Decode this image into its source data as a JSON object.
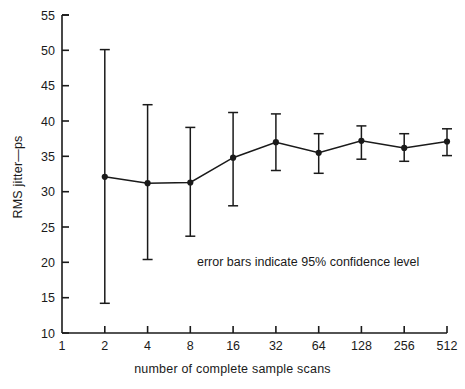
{
  "chart_data": {
    "type": "line",
    "title": "",
    "xlabel": "number of complete sample scans",
    "ylabel": "RMS jitter—ps",
    "x_tick_labels": [
      "1",
      "2",
      "4",
      "8",
      "16",
      "32",
      "64",
      "128",
      "256",
      "512"
    ],
    "x_scale": "log2",
    "y_tick_labels": [
      "10",
      "15",
      "20",
      "25",
      "30",
      "35",
      "40",
      "45",
      "50",
      "55"
    ],
    "ylim": [
      10,
      55
    ],
    "grid": false,
    "legend": null,
    "annotations": [
      {
        "text": "error bars indicate 95% confidence level",
        "x": 32,
        "y": 22
      }
    ],
    "categories": [
      "2",
      "4",
      "8",
      "16",
      "32",
      "64",
      "128",
      "256",
      "512"
    ],
    "series": [
      {
        "name": "RMS jitter",
        "marker": "filled-circle",
        "values": [
          32.1,
          31.2,
          31.3,
          34.8,
          37.0,
          35.5,
          37.2,
          36.2,
          37.1
        ],
        "error_low": [
          14.2,
          20.4,
          23.7,
          28.0,
          33.0,
          32.6,
          34.6,
          34.3,
          35.1
        ],
        "error_high": [
          50.1,
          42.3,
          39.1,
          41.2,
          41.0,
          38.2,
          39.3,
          38.2,
          38.9
        ]
      }
    ]
  }
}
